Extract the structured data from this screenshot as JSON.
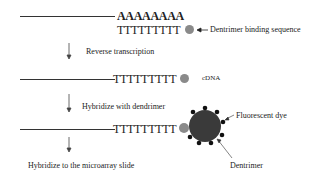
{
  "step1": {
    "poly_a": "AAAAAAAA",
    "oligo_dt": "TTTTTTTTT",
    "label": "Dentrimer binding sequence"
  },
  "arrows": {
    "step1_label": "Reverse transcription",
    "step2_label": "Hybridize with dendrimer",
    "step3_label": "Hybridize to the microarray slide"
  },
  "step2": {
    "sequence": "TTTTTTTTT",
    "label": "cDNA"
  },
  "step3": {
    "sequence": "TTTTTTTTT",
    "fluor_label": "Fluorescent dye",
    "dendrimer_label": "Dentrimer"
  },
  "colors": {
    "line": "#333333",
    "binding_dot": "#8a8a8a",
    "dendrimer": "#3a3a3a",
    "dye_dots": "#111111"
  }
}
